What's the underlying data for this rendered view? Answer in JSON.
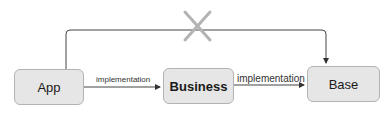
{
  "diagram": {
    "nodes": [
      {
        "id": "app",
        "label": "App"
      },
      {
        "id": "business",
        "label": "Business"
      },
      {
        "id": "base",
        "label": "Base"
      }
    ],
    "edges": [
      {
        "from": "app",
        "to": "business",
        "label": "implementation"
      },
      {
        "from": "business",
        "to": "base",
        "label": "implementation"
      },
      {
        "from": "app",
        "to": "base",
        "label": "",
        "crossed_out": true
      }
    ],
    "colors": {
      "node_fill": "#e6e6e6",
      "node_border": "#b3b3b3",
      "edge": "#333333",
      "cross": "#b3b3b3"
    }
  }
}
